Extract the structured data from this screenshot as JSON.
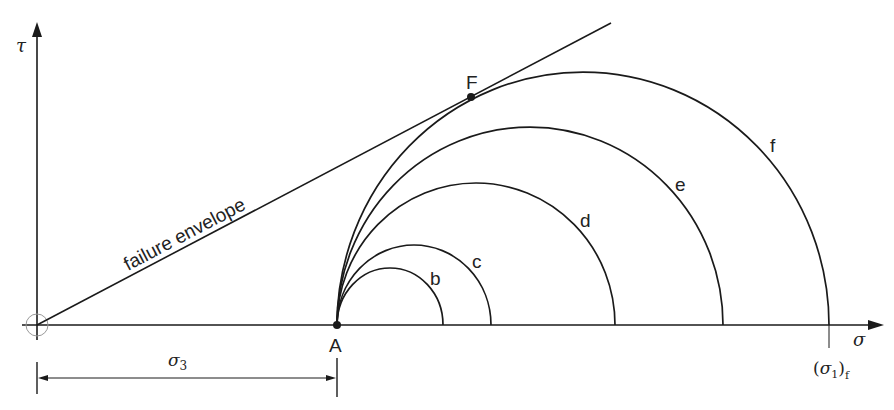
{
  "figure": {
    "type": "Mohr circle diagram",
    "axes": {
      "x_label": "σ",
      "y_label": "τ"
    },
    "envelope_label": "failure envelope",
    "points": {
      "A": "A",
      "F": "F"
    },
    "circles": [
      {
        "label": "b"
      },
      {
        "label": "c"
      },
      {
        "label": "d"
      },
      {
        "label": "e"
      },
      {
        "label": "f"
      }
    ],
    "dimension": {
      "label": "σ",
      "subscript": "3"
    },
    "failure_stress": {
      "open": "(",
      "sigma": "σ",
      "sub1": "1",
      "close": ")",
      "subf": "f"
    },
    "colors": {
      "line": "#1a1a1a",
      "text": "#222222",
      "background": "#ffffff"
    }
  }
}
